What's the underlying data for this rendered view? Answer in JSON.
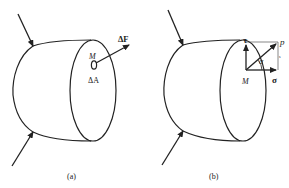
{
  "panels": [
    {
      "id": "a",
      "caption": "(a)",
      "labels": {
        "point": "M",
        "force": "ΔF",
        "area": "ΔA"
      }
    },
    {
      "id": "b",
      "caption": "(b)",
      "labels": {
        "point": "M",
        "shear_stress": "τ",
        "total_stress": "p",
        "normal_stress": "σ",
        "angle": "α"
      }
    }
  ],
  "colors": {
    "stroke": "#222222",
    "background": "#ffffff"
  }
}
